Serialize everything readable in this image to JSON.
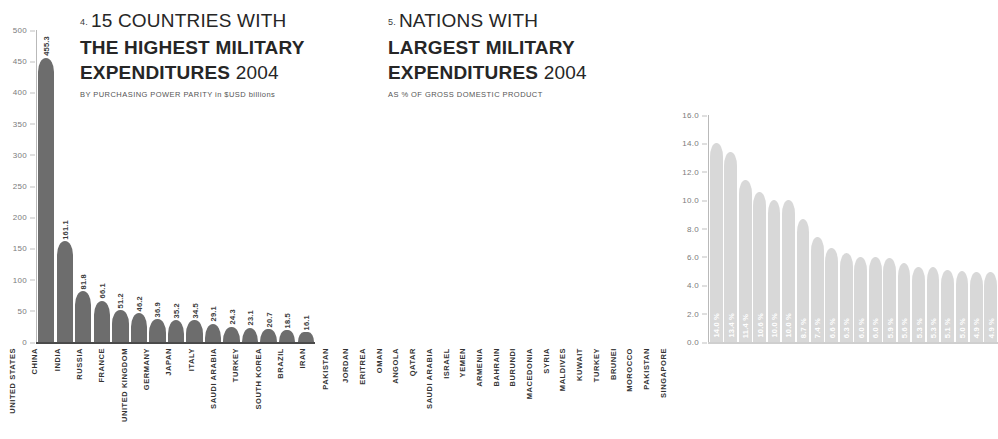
{
  "chart_data": [
    {
      "type": "bar",
      "panel": "left",
      "number": "4.",
      "title_line1": "15 COUNTRIES WITH",
      "title_line2": "THE HIGHEST MILITARY",
      "title_line3": "EXPENDITURES",
      "title_year": "2004",
      "subtitle_caps": "BY PURCHASING POWER PARITY in ",
      "subtitle": "BY PURCHASING POWER PARITY in $USD billions",
      "xlabel": "",
      "ylabel": "",
      "ylim": [
        0,
        500
      ],
      "yticks": [
        "500",
        "450",
        "400",
        "350",
        "300",
        "250",
        "200",
        "150",
        "100",
        "50",
        "0"
      ],
      "ytick_values": [
        500,
        450,
        400,
        350,
        300,
        250,
        200,
        150,
        100,
        50,
        0
      ],
      "grid": false,
      "bar_color": "#6d6d6d",
      "categories": [
        "UNITED STATES",
        "CHINA",
        "INDIA",
        "RUSSIA",
        "FRANCE",
        "UNITED KINGDOM",
        "GERMANY",
        "JAPAN",
        "ITALY",
        "SAUDI ARABIA",
        "TURKEY",
        "SOUTH KOREA",
        "BRAZIL",
        "IRAN",
        "PAKISTAN"
      ],
      "values": [
        455.3,
        161.1,
        81.8,
        66.1,
        51.2,
        46.2,
        36.9,
        35.2,
        34.5,
        29.1,
        24.3,
        23.1,
        20.7,
        18.5,
        16.1
      ],
      "value_labels": [
        "455.3",
        "161.1",
        "81.8",
        "66.1",
        "51.2",
        "46.2",
        "36.9",
        "35.2",
        "34.5",
        "29.1",
        "24.3",
        "23.1",
        "20.7",
        "18.5",
        "16.1"
      ]
    },
    {
      "type": "bar",
      "panel": "right",
      "number": "5.",
      "title_line1": "NATIONS WITH",
      "title_line2": "LARGEST MILITARY",
      "title_line3": "EXPENDITURES",
      "title_year": "2004",
      "subtitle": "AS % OF GROSS DOMESTIC PRODUCT",
      "xlabel": "",
      "ylabel": "",
      "ylim": [
        0,
        16
      ],
      "yticks": [
        "16.0",
        "14.0",
        "12.0",
        "10.0",
        "8.0",
        "6.0",
        "4.0",
        "2.0",
        "0.0"
      ],
      "ytick_values": [
        16.0,
        14.0,
        12.0,
        10.0,
        8.0,
        6.0,
        4.0,
        2.0,
        0.0
      ],
      "grid": false,
      "bar_color": "#d8d8d8",
      "categories": [
        "JORDAN",
        "ERITREA",
        "OMAN",
        "ANGOLA",
        "QATAR",
        "SAUDI ARABIA",
        "ISRAEL",
        "YEMEN",
        "ARMENIA",
        "BAHRAIN",
        "BURUNDI",
        "MACEDONIA",
        "SYRIA",
        "MALDIVES",
        "KUWAIT",
        "TURKEY",
        "BRUNEI",
        "MOROCCO",
        "PAKISTAN",
        "SINGAPORE"
      ],
      "values": [
        14.0,
        13.4,
        11.4,
        10.6,
        10.0,
        10.0,
        8.7,
        7.4,
        6.6,
        6.3,
        6.0,
        6.0,
        5.9,
        5.6,
        5.3,
        5.3,
        5.1,
        5.0,
        4.9,
        4.9
      ],
      "value_labels": [
        "14.0 %",
        "13.4 %",
        "11.4 %",
        "10.6 %",
        "10.0 %",
        "10.0 %",
        "8.7 %",
        "7.4 %",
        "6.6 %",
        "6.3 %",
        "6.0 %",
        "6.0 %",
        "5.9 %",
        "5.6 %",
        "5.3 %",
        "5.3 %",
        "5.1 %",
        "5.0 %",
        "4.9 %",
        "4.9 %"
      ]
    }
  ]
}
